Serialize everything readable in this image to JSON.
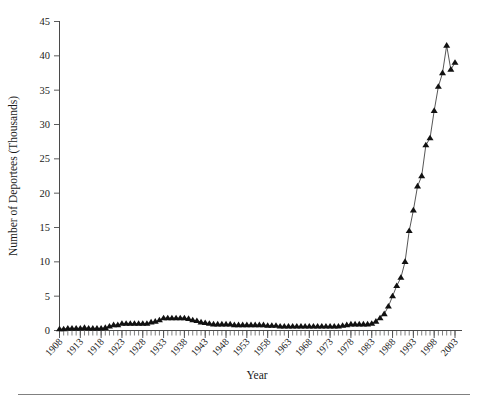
{
  "chart_data": {
    "type": "line",
    "title": "",
    "xlabel": "Year",
    "ylabel": "Number of Deportees (Thousands)",
    "xlim": [
      1908,
      2003
    ],
    "ylim": [
      0,
      45
    ],
    "yticks": [
      0,
      5,
      10,
      15,
      20,
      25,
      30,
      35,
      40,
      45
    ],
    "ytick_labels": [
      "0",
      "5",
      "10",
      "15",
      "20",
      "25",
      "30",
      "35",
      "40",
      "45"
    ],
    "xticks": [
      1908,
      1913,
      1918,
      1923,
      1928,
      1933,
      1938,
      1943,
      1948,
      1953,
      1958,
      1963,
      1968,
      1973,
      1978,
      1983,
      1988,
      1993,
      1998,
      2003
    ],
    "xtick_labels": [
      "1908",
      "1913",
      "1918",
      "1923",
      "1928",
      "1933",
      "1938",
      "1943",
      "1948",
      "1953",
      "1958",
      "1963",
      "1968",
      "1973",
      "1978",
      "1983",
      "1988",
      "1993",
      "1998",
      "2003"
    ],
    "minor_ticks": "annual",
    "grid": false,
    "legend": "none",
    "marker": "triangle-up",
    "marker_color": "#111111",
    "line_color": "#2b2b2b",
    "x": [
      1908,
      1909,
      1910,
      1911,
      1912,
      1913,
      1914,
      1915,
      1916,
      1917,
      1918,
      1919,
      1920,
      1921,
      1922,
      1923,
      1924,
      1925,
      1926,
      1927,
      1928,
      1929,
      1930,
      1931,
      1932,
      1933,
      1934,
      1935,
      1936,
      1937,
      1938,
      1939,
      1940,
      1941,
      1942,
      1943,
      1944,
      1945,
      1946,
      1947,
      1948,
      1949,
      1950,
      1951,
      1952,
      1953,
      1954,
      1955,
      1956,
      1957,
      1958,
      1959,
      1960,
      1961,
      1962,
      1963,
      1964,
      1965,
      1966,
      1967,
      1968,
      1969,
      1970,
      1971,
      1972,
      1973,
      1974,
      1975,
      1976,
      1977,
      1978,
      1979,
      1980,
      1981,
      1982,
      1983,
      1984,
      1985,
      1986,
      1987,
      1988,
      1989,
      1990,
      1991,
      1992,
      1993,
      1994,
      1995,
      1996,
      1997,
      1998,
      1999,
      2000,
      2001,
      2002,
      2003
    ],
    "values": [
      0.2,
      0.2,
      0.3,
      0.3,
      0.3,
      0.3,
      0.4,
      0.3,
      0.3,
      0.3,
      0.3,
      0.4,
      0.6,
      0.8,
      0.8,
      1.0,
      1.0,
      1.0,
      1.0,
      1.0,
      1.0,
      1.0,
      1.2,
      1.3,
      1.5,
      1.8,
      1.8,
      1.8,
      1.8,
      1.8,
      1.8,
      1.7,
      1.5,
      1.4,
      1.2,
      1.1,
      1.0,
      0.9,
      0.9,
      0.9,
      0.9,
      0.9,
      0.8,
      0.8,
      0.8,
      0.8,
      0.8,
      0.8,
      0.8,
      0.8,
      0.7,
      0.7,
      0.7,
      0.6,
      0.6,
      0.6,
      0.6,
      0.6,
      0.6,
      0.6,
      0.6,
      0.6,
      0.6,
      0.6,
      0.6,
      0.6,
      0.6,
      0.6,
      0.7,
      0.8,
      0.9,
      0.9,
      0.9,
      0.9,
      0.9,
      1.0,
      1.3,
      1.8,
      2.4,
      3.5,
      5.0,
      6.5,
      7.7,
      10.0,
      14.5,
      17.5,
      21.0,
      22.5,
      27.0,
      28.0,
      32.0,
      35.5,
      37.5,
      41.5,
      38.0,
      39.0
    ]
  },
  "figure": {
    "y_axis_title": "Number of Deportees (Thousands)",
    "x_axis_title": "Year"
  }
}
